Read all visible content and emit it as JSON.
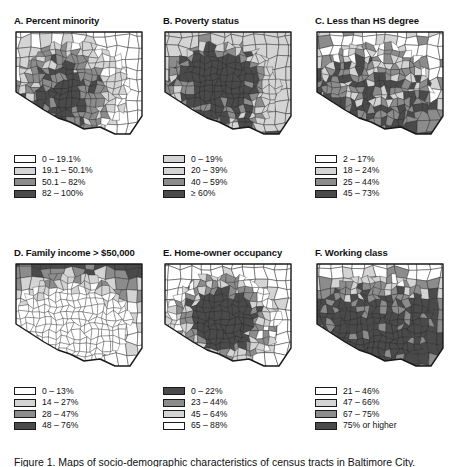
{
  "figure": {
    "caption": "Figure 1. Maps of socio-demographic characteristics of census tracts in Baltimore City.",
    "shade_colors": {
      "s0": "#ffffff",
      "s1": "#d4d4d4",
      "s2": "#8c8c8c",
      "s3": "#4a4a4a",
      "outline": "#1a1a1a"
    }
  },
  "panels": [
    {
      "id": "a",
      "title": "A. Percent minority",
      "legend": [
        {
          "label": "0 – 19.1%",
          "shade": "s0"
        },
        {
          "label": "19.1 – 50.1%",
          "shade": "s1"
        },
        {
          "label": "50.1 – 82%",
          "shade": "s2"
        },
        {
          "label": "82 – 100%",
          "shade": "s3"
        }
      ]
    },
    {
      "id": "b",
      "title": "B. Poverty status",
      "legend": [
        {
          "label": "0 – 19%",
          "shade": "s1"
        },
        {
          "label": "20 – 39%",
          "shade": "s1"
        },
        {
          "label": "40 – 59%",
          "shade": "s2"
        },
        {
          "label": "≥ 60%",
          "shade": "s3"
        }
      ]
    },
    {
      "id": "c",
      "title": "C. Less than HS degree",
      "legend": [
        {
          "label": "2 – 17%",
          "shade": "s0"
        },
        {
          "label": "18 – 24%",
          "shade": "s1"
        },
        {
          "label": "25 – 44%",
          "shade": "s2"
        },
        {
          "label": "45 – 73%",
          "shade": "s3"
        }
      ]
    },
    {
      "id": "d",
      "title": "D. Family income > $50,000",
      "legend": [
        {
          "label": "0 – 13%",
          "shade": "s0"
        },
        {
          "label": "14 – 27%",
          "shade": "s1"
        },
        {
          "label": "28 – 47%",
          "shade": "s2"
        },
        {
          "label": "48 – 76%",
          "shade": "s3"
        }
      ]
    },
    {
      "id": "e",
      "title": "E. Home-owner occupancy",
      "legend": [
        {
          "label": "0 – 22%",
          "shade": "s3"
        },
        {
          "label": "23 – 44%",
          "shade": "s2"
        },
        {
          "label": "45 – 64%",
          "shade": "s1"
        },
        {
          "label": "65 – 88%",
          "shade": "s0"
        }
      ]
    },
    {
      "id": "f",
      "title": "F. Working class",
      "legend": [
        {
          "label": "21 – 46%",
          "shade": "s0"
        },
        {
          "label": "47 – 66%",
          "shade": "s1"
        },
        {
          "label": "67 – 75%",
          "shade": "s2"
        },
        {
          "label": "75% or higher",
          "shade": "s3"
        }
      ]
    }
  ],
  "chart_data": {
    "type": "map",
    "title": "Socio-demographic characteristics of census tracts in Baltimore City",
    "region": "Baltimore City",
    "unit": "census tract",
    "panel_count": 6,
    "classes_per_panel": 4,
    "grid": false,
    "legend_position": "below-map",
    "maps": [
      {
        "panel": "A",
        "variable": "Percent minority",
        "breaks": [
          "0 – 19.1%",
          "19.1 – 50.1%",
          "50.1 – 82%",
          "82 – 100%"
        ],
        "shades": [
          "#ffffff",
          "#d4d4d4",
          "#8c8c8c",
          "#4a4a4a"
        ],
        "ramp_direction": "light-to-dark"
      },
      {
        "panel": "B",
        "variable": "Poverty status",
        "breaks": [
          "0 – 19%",
          "20 – 39%",
          "40 – 59%",
          "≥ 60%"
        ],
        "shades": [
          "#e6e6e6",
          "#d4d4d4",
          "#8c8c8c",
          "#4a4a4a"
        ],
        "ramp_direction": "light-to-dark"
      },
      {
        "panel": "C",
        "variable": "Less than HS degree",
        "breaks": [
          "2 – 17%",
          "18 – 24%",
          "25 – 44%",
          "45 – 73%"
        ],
        "shades": [
          "#ffffff",
          "#d4d4d4",
          "#8c8c8c",
          "#4a4a4a"
        ],
        "ramp_direction": "light-to-dark"
      },
      {
        "panel": "D",
        "variable": "Family income > $50,000",
        "breaks": [
          "0 – 13%",
          "14 – 27%",
          "28 – 47%",
          "48 – 76%"
        ],
        "shades": [
          "#ffffff",
          "#d4d4d4",
          "#8c8c8c",
          "#4a4a4a"
        ],
        "ramp_direction": "light-to-dark"
      },
      {
        "panel": "E",
        "variable": "Home-owner occupancy",
        "breaks": [
          "0 – 22%",
          "23 – 44%",
          "45 – 64%",
          "65 – 88%"
        ],
        "shades": [
          "#4a4a4a",
          "#8c8c8c",
          "#d4d4d4",
          "#ffffff"
        ],
        "ramp_direction": "dark-to-light"
      },
      {
        "panel": "F",
        "variable": "Working class",
        "breaks": [
          "21 – 46%",
          "47 – 66%",
          "67 – 75%",
          "75% or higher"
        ],
        "shades": [
          "#ffffff",
          "#d4d4d4",
          "#8c8c8c",
          "#4a4a4a"
        ],
        "ramp_direction": "light-to-dark"
      }
    ]
  }
}
